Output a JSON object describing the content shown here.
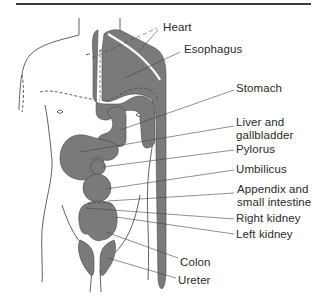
{
  "figure": {
    "type": "anatomical-diagram",
    "colors": {
      "organ_fill": "#7a7a7a",
      "outline": "#3a3a3a",
      "leader": "#444444",
      "rule": "#3a3a3a",
      "text": "#2a2a2a"
    },
    "labels": [
      {
        "id": "heart",
        "lines": [
          "Heart"
        ]
      },
      {
        "id": "esophagus",
        "lines": [
          "Esophagus"
        ]
      },
      {
        "id": "stomach",
        "lines": [
          "Stomach"
        ]
      },
      {
        "id": "liver",
        "lines": [
          "Liver and",
          "gallbladder"
        ]
      },
      {
        "id": "pylorus",
        "lines": [
          "Pylorus"
        ]
      },
      {
        "id": "umbilicus",
        "lines": [
          "Umbilicus"
        ]
      },
      {
        "id": "appendix",
        "lines": [
          "Appendix and",
          "small intestine"
        ]
      },
      {
        "id": "right-kidney",
        "lines": [
          "Right kidney"
        ]
      },
      {
        "id": "left-kidney",
        "lines": [
          "Left kidney"
        ]
      },
      {
        "id": "colon",
        "lines": [
          "Colon"
        ]
      },
      {
        "id": "ureter",
        "lines": [
          "Ureter"
        ]
      }
    ]
  }
}
